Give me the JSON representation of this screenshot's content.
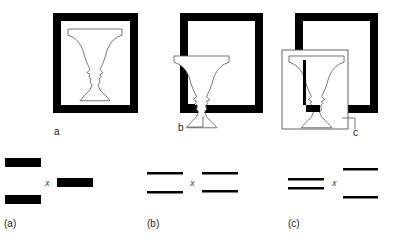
{
  "figure": {
    "top_row": {
      "panels": [
        {
          "id": "a",
          "label": "a",
          "description": "vase/faces inside black frame"
        },
        {
          "id": "b",
          "label": "b",
          "description": "vase overlapping frame, faces region white over frame"
        },
        {
          "id": "c",
          "label": "c",
          "description": "vase and faces on separate white card overlapping frame"
        }
      ]
    },
    "bottom_row": {
      "panels": [
        {
          "id": "a",
          "label": "(a)",
          "fixation_mark": "x",
          "description": "thick bars, two stacked left, one right"
        },
        {
          "id": "b",
          "label": "(b)",
          "fixation_mark": "x",
          "description": "thin line pairs, equal spacing left and right"
        },
        {
          "id": "c",
          "label": "(c)",
          "fixation_mark": "x",
          "description": "close line pair left, wide line pair right"
        }
      ]
    },
    "colors": {
      "ink": "#000000",
      "outline": "#555555",
      "background": "#ffffff"
    }
  }
}
